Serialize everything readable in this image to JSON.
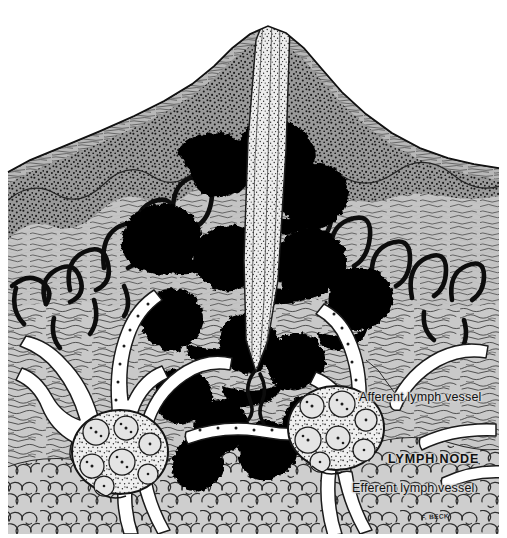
{
  "figure": {
    "background_color": "#ffffff",
    "tissue_gray": "#c9c9c9",
    "ink_black": "#000000",
    "vessel_white": "#ffffff"
  },
  "labels": {
    "afferent": "Afferent lymph vessel",
    "lymph_node": "LYMPH  NODE",
    "efferent": "Efferent lymph vessel",
    "signature": "F. BECK"
  },
  "regions": [
    {
      "name": "epidermis",
      "note": "stippled dark band along skin surface"
    },
    {
      "name": "dermis",
      "note": "gray wavy-fiber connective tissue"
    },
    {
      "name": "subcutaneous-fat",
      "note": "bubbly adipose cells along bottom"
    },
    {
      "name": "splinter",
      "note": "stippled foreign body entering skin at apex"
    },
    {
      "name": "infection-mass",
      "note": "solid black spreading inflammation"
    },
    {
      "name": "blood-capillary-loops",
      "note": "black looping vessels in dermal papillae"
    },
    {
      "name": "lymph-vessel-network",
      "note": "white branching vessels with valve dots"
    },
    {
      "name": "lymph-node-left",
      "note": "ovoid node with germinal centers"
    },
    {
      "name": "lymph-node-right",
      "note": "ovoid node with germinal centers"
    }
  ]
}
